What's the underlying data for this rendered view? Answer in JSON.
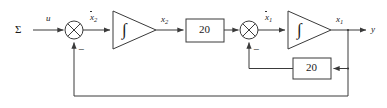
{
  "diagram": {
    "type": "control-block-diagram",
    "stroke_color": "#3a3a3a",
    "text_color": "#1a1a1a",
    "background": "#ffffff",
    "labels": {
      "system": "Σ",
      "input": "u",
      "state_dot_2": "x",
      "state_dot_2_sub": "2",
      "state_2": "x",
      "state_2_sub": "2",
      "state_dot_1": "x",
      "state_dot_1_sub": "1",
      "state_1": "x",
      "state_1_sub": "1",
      "output": "y",
      "minus_outer": "−",
      "minus_inner": "−"
    },
    "blocks": [
      {
        "name": "summing-junction-1",
        "kind": "summing-junction",
        "glyph": "⊗",
        "cx": 74,
        "cy": 30,
        "r": 9
      },
      {
        "name": "integrator-1",
        "kind": "integrator",
        "glyph": "∫",
        "x": 113,
        "y": 11,
        "w": 43,
        "h": 38
      },
      {
        "name": "gain-forward",
        "kind": "gain",
        "value": "20",
        "x": 186,
        "y": 19,
        "w": 38,
        "h": 23
      },
      {
        "name": "summing-junction-2",
        "kind": "summing-junction",
        "glyph": "⊗",
        "cx": 249,
        "cy": 30,
        "r": 9
      },
      {
        "name": "integrator-2",
        "kind": "integrator",
        "glyph": "∫",
        "x": 288,
        "y": 11,
        "w": 43,
        "h": 38
      },
      {
        "name": "gain-feedback",
        "kind": "gain",
        "value": "20",
        "x": 293,
        "y": 58,
        "w": 38,
        "h": 21
      }
    ],
    "gains": {
      "forward": "20",
      "feedback": "20"
    }
  }
}
